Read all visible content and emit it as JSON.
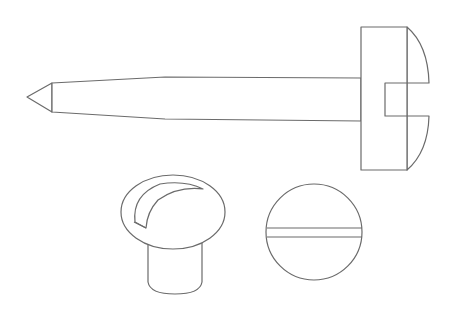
{
  "figure": {
    "views": [
      {
        "id": "side-view",
        "label": "Side view (shank, tip and head with slot)"
      },
      {
        "id": "perspective-view",
        "label": "Perspective view of domed head"
      },
      {
        "id": "top-view",
        "label": "Top view of head with slot"
      }
    ],
    "colors": {
      "stroke": "#6b6b6b",
      "background": "#ffffff"
    }
  }
}
